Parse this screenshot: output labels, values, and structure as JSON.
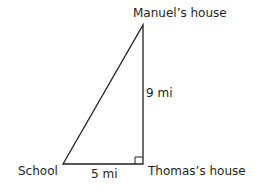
{
  "diagram": {
    "type": "right-triangle",
    "vertices": {
      "top": {
        "label": "Manuel’s house"
      },
      "right_angle": {
        "label": "Thomas’s house"
      },
      "left": {
        "label": "School"
      }
    },
    "sides": {
      "vertical": {
        "label": "9 mi"
      },
      "horizontal": {
        "label": "5 mi"
      }
    },
    "colors": {
      "line": "#231f20",
      "text": "#231f20",
      "background": "#ffffff"
    }
  }
}
